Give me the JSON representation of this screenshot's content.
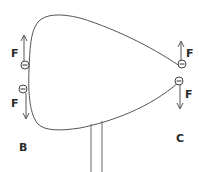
{
  "diagram": {
    "labels": {
      "point_b": "B",
      "point_c": "C",
      "force_b_top": "F",
      "force_b_bottom": "F",
      "force_c_top": "F",
      "force_c_bottom": "F"
    },
    "charges": [
      {
        "id": "b_top",
        "sign": "−",
        "x": 25,
        "y": 65
      },
      {
        "id": "b_bottom",
        "sign": "−",
        "x": 23,
        "y": 89
      },
      {
        "id": "c_top",
        "sign": "−",
        "x": 182,
        "y": 64
      },
      {
        "id": "c_bottom",
        "sign": "−",
        "x": 179,
        "y": 81
      }
    ],
    "colors": {
      "stroke": "#555555",
      "text": "#2a2a2a",
      "background": "#ffffff"
    }
  }
}
